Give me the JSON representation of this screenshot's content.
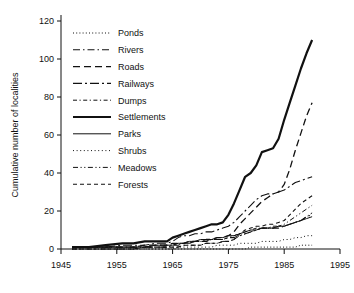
{
  "chart_data": {
    "type": "line",
    "title": "",
    "subtitle": "",
    "xlabel": "",
    "ylabel": "Cumulative number of localities",
    "xlim": [
      1945,
      1995
    ],
    "ylim": [
      0,
      120
    ],
    "xticks": [
      1945,
      1955,
      1965,
      1975,
      1985,
      1995
    ],
    "yticks": [
      0,
      20,
      40,
      60,
      80,
      100,
      120
    ],
    "xtick_labels": [
      "1945",
      "1955",
      "1965",
      "1975",
      "1985",
      "1995"
    ],
    "ytick_labels": [
      "0",
      "20",
      "40",
      "60",
      "80",
      "100",
      "120"
    ],
    "grid": false,
    "legend_position": "upper-left-inside",
    "x": [
      1947,
      1950,
      1953,
      1956,
      1958,
      1960,
      1962,
      1964,
      1965,
      1966,
      1967,
      1968,
      1969,
      1970,
      1971,
      1972,
      1973,
      1974,
      1975,
      1976,
      1977,
      1978,
      1979,
      1980,
      1981,
      1982,
      1983,
      1984,
      1985,
      1986,
      1987,
      1988,
      1989,
      1990
    ],
    "series": [
      {
        "name": "Ponds",
        "linestyle": "dotted-fine",
        "color": "#111111",
        "width": 1.0,
        "values": [
          0,
          0,
          0,
          0,
          0,
          0,
          0,
          0,
          0,
          0,
          0,
          0,
          0,
          0,
          0,
          0,
          0,
          0,
          0,
          0,
          0,
          0,
          1,
          1,
          1,
          1,
          1,
          1,
          1,
          1,
          1,
          2,
          2,
          2
        ]
      },
      {
        "name": "Rivers",
        "linestyle": "dash-dot",
        "color": "#111111",
        "width": 1.1,
        "values": [
          1,
          1,
          1,
          1,
          1,
          1,
          1,
          1,
          2,
          2,
          3,
          3,
          4,
          4,
          4,
          5,
          5,
          5,
          6,
          6,
          7,
          8,
          9,
          10,
          11,
          11,
          11,
          11,
          12,
          13,
          14,
          15,
          17,
          18
        ]
      },
      {
        "name": "Roads",
        "linestyle": "dashed-long",
        "color": "#111111",
        "width": 1.3,
        "values": [
          1,
          1,
          1,
          1,
          1,
          2,
          2,
          2,
          3,
          3,
          3,
          4,
          4,
          4,
          5,
          5,
          6,
          6,
          7,
          9,
          13,
          16,
          19,
          22,
          25,
          27,
          29,
          30,
          34,
          42,
          52,
          61,
          70,
          77
        ]
      },
      {
        "name": "Railways",
        "linestyle": "dash-dot-long",
        "color": "#111111",
        "width": 1.1,
        "values": [
          1,
          1,
          1,
          2,
          2,
          2,
          3,
          3,
          4,
          6,
          7,
          7,
          8,
          8,
          9,
          9,
          10,
          11,
          12,
          14,
          17,
          20,
          23,
          26,
          28,
          29,
          29,
          30,
          31,
          33,
          35,
          36,
          37,
          38
        ]
      },
      {
        "name": "Dumps",
        "linestyle": "dash-dot-short",
        "color": "#111111",
        "width": 1.0,
        "values": [
          1,
          1,
          1,
          1,
          1,
          1,
          2,
          2,
          2,
          3,
          3,
          3,
          4,
          4,
          4,
          5,
          5,
          5,
          6,
          7,
          8,
          9,
          10,
          11,
          11,
          11,
          12,
          12,
          12,
          13,
          14,
          15,
          17,
          19
        ]
      },
      {
        "name": "Settlements",
        "linestyle": "solid-thick",
        "color": "#111111",
        "width": 2.2,
        "values": [
          1,
          1,
          2,
          3,
          3,
          4,
          4,
          4,
          6,
          7,
          8,
          9,
          10,
          11,
          12,
          13,
          13,
          14,
          18,
          24,
          31,
          38,
          40,
          44,
          51,
          52,
          53,
          58,
          68,
          77,
          86,
          95,
          103,
          110
        ]
      },
      {
        "name": "Parks",
        "linestyle": "solid-thin",
        "color": "#555555",
        "width": 1.0,
        "values": [
          1,
          1,
          1,
          1,
          1,
          1,
          2,
          2,
          2,
          3,
          3,
          4,
          4,
          5,
          5,
          5,
          6,
          6,
          7,
          7,
          8,
          9,
          10,
          10,
          11,
          11,
          11,
          12,
          12,
          13,
          14,
          15,
          16,
          17
        ]
      },
      {
        "name": "Shrubs",
        "linestyle": "dotted",
        "color": "#111111",
        "width": 1.0,
        "values": [
          0,
          0,
          0,
          0,
          0,
          0,
          0,
          0,
          0,
          1,
          1,
          1,
          1,
          1,
          1,
          1,
          2,
          2,
          2,
          2,
          3,
          3,
          3,
          3,
          4,
          4,
          4,
          4,
          5,
          5,
          6,
          6,
          7,
          7
        ]
      },
      {
        "name": "Meadows",
        "linestyle": "dash-dot-dot",
        "color": "#111111",
        "width": 1.0,
        "values": [
          0,
          0,
          0,
          0,
          0,
          1,
          1,
          1,
          1,
          1,
          2,
          2,
          2,
          2,
          3,
          3,
          3,
          4,
          4,
          5,
          7,
          8,
          9,
          10,
          11,
          11,
          11,
          12,
          13,
          15,
          17,
          19,
          21,
          23
        ]
      },
      {
        "name": "Forests",
        "linestyle": "dashed-short",
        "color": "#111111",
        "width": 1.1,
        "values": [
          0,
          0,
          0,
          0,
          0,
          1,
          1,
          1,
          1,
          1,
          2,
          2,
          2,
          2,
          3,
          3,
          3,
          4,
          4,
          5,
          8,
          10,
          11,
          12,
          12,
          13,
          13,
          14,
          15,
          18,
          21,
          24,
          26,
          28
        ]
      }
    ]
  },
  "legend": {
    "entries": [
      {
        "label": "Ponds"
      },
      {
        "label": "Rivers"
      },
      {
        "label": "Roads"
      },
      {
        "label": "Railways"
      },
      {
        "label": "Dumps"
      },
      {
        "label": "Settlements"
      },
      {
        "label": "Parks"
      },
      {
        "label": "Shrubs"
      },
      {
        "label": "Meadows"
      },
      {
        "label": "Forests"
      }
    ]
  }
}
